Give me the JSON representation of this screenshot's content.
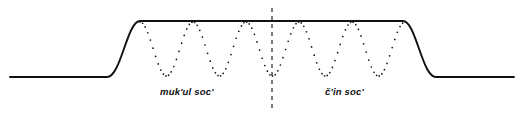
{
  "figure": {
    "type": "intonation-contour-diagram",
    "background_color": "#ffffff",
    "stroke_color": "#111111",
    "labels": {
      "left": "muk'ul soc'",
      "right": "č'in soc'"
    },
    "envelope": {
      "style": "solid",
      "description": "flat low baseline rising in an S-curve to a high plateau, then falling back to the baseline",
      "baseline_y": 77,
      "plateau_y": 21,
      "left_baseline_start_x": 10,
      "rise_start_x": 107,
      "rise_end_x": 140,
      "fall_start_x": 403,
      "fall_end_x": 436,
      "right_baseline_end_x": 514
    },
    "oscillation": {
      "style": "dotted",
      "shape": "sinusoid",
      "period_px": 53,
      "peak_y": 22,
      "trough_y": 76,
      "peak_positions_x": [
        140,
        193,
        246,
        299,
        352,
        405
      ],
      "trough_positions_x": [
        166,
        219,
        272,
        325,
        378
      ],
      "dot_radius": 0.85,
      "dot_spacing": 2.6
    },
    "divider": {
      "style": "dashed",
      "orientation": "vertical",
      "x": 272,
      "y_top": 8,
      "y_bottom": 108,
      "dash": "4 4"
    }
  }
}
